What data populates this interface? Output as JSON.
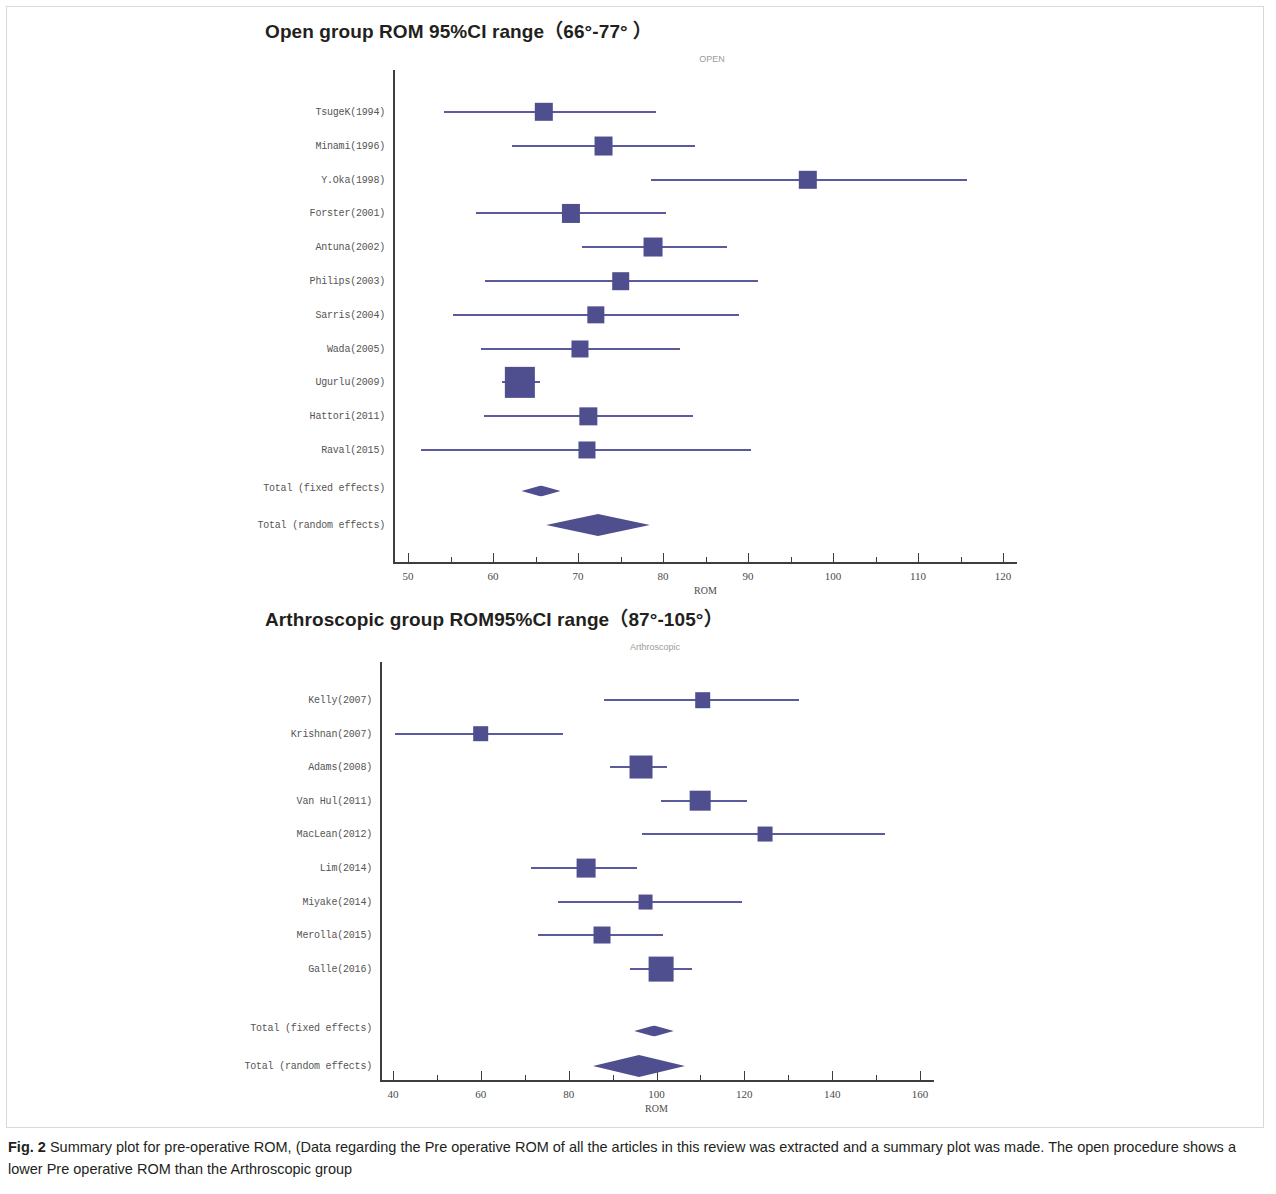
{
  "figure": {
    "caption_label": "Fig. 2",
    "caption_text": " Summary plot for pre-operative ROM, (Data regarding the Pre operative ROM of all the articles in this review was extracted and a summary plot was made. The open procedure shows a lower Pre operative ROM than the Arthroscopic group",
    "marker_color": "#4f4e8f",
    "line_color": "#5b5a9c",
    "axis_color": "#3d3d3d"
  },
  "panels": [
    {
      "heading": "Open group ROM 95%CI range（66°-77°  ）",
      "inner_title": "OPEN"
    },
    {
      "heading": "Arthroscopic group ROM95%CI range（87°-105°）",
      "inner_title": "Arthroscopic"
    }
  ],
  "chart_data": [
    {
      "type": "forest",
      "title": "OPEN",
      "panel_heading": "Open group ROM 95%CI range（66°-77°  ）",
      "xlabel": "ROM",
      "ylabel": "",
      "xlim": [
        48,
        122
      ],
      "xticks": [
        50,
        60,
        70,
        80,
        90,
        100,
        110,
        120
      ],
      "xtick_labels": [
        "50",
        "60",
        "70",
        "80",
        "90",
        "100",
        "110",
        "120"
      ],
      "minor_tick_step": 5,
      "grid": false,
      "legend": "none",
      "studies": [
        {
          "label": "TsugeK(1994)",
          "estimate": 66.0,
          "ci_low": 54.2,
          "ci_high": 79.2,
          "weight": 1.0
        },
        {
          "label": "Minami(1996)",
          "estimate": 73.0,
          "ci_low": 62.2,
          "ci_high": 83.8,
          "weight": 1.1
        },
        {
          "label": "Y.Oka(1998)",
          "estimate": 97.0,
          "ci_low": 78.6,
          "ci_high": 115.8,
          "weight": 1.0
        },
        {
          "label": "Forster(2001)",
          "estimate": 69.2,
          "ci_low": 58.0,
          "ci_high": 80.4,
          "weight": 0.95
        },
        {
          "label": "Antuna(2002)",
          "estimate": 78.8,
          "ci_low": 70.5,
          "ci_high": 87.5,
          "weight": 1.1
        },
        {
          "label": "Philips(2003)",
          "estimate": 75.0,
          "ci_low": 59.0,
          "ci_high": 91.2,
          "weight": 0.85
        },
        {
          "label": "Sarris(2004)",
          "estimate": 72.1,
          "ci_low": 55.3,
          "ci_high": 89.0,
          "weight": 0.8
        },
        {
          "label": "Wada(2005)",
          "estimate": 70.2,
          "ci_low": 58.6,
          "ci_high": 82.0,
          "weight": 0.75
        },
        {
          "label": "Ugurlu(2009)",
          "estimate": 63.2,
          "ci_low": 61.0,
          "ci_high": 65.5,
          "weight": 3.2
        },
        {
          "label": "Hattori(2011)",
          "estimate": 71.2,
          "ci_low": 58.9,
          "ci_high": 83.5,
          "weight": 0.8
        },
        {
          "label": "Raval(2015)",
          "estimate": 71.0,
          "ci_low": 51.5,
          "ci_high": 90.4,
          "weight": 0.75
        }
      ],
      "summaries": [
        {
          "label": "Total (fixed effects)",
          "estimate": 65.6,
          "ci_low": 63.3,
          "ci_high": 67.9
        },
        {
          "label": "Total (random effects)",
          "estimate": 72.4,
          "ci_low": 66.1,
          "ci_high": 78.3
        }
      ]
    },
    {
      "type": "forest",
      "title": "Arthroscopic",
      "panel_heading": "Arthroscopic group ROM95%CI range（87°-105°）",
      "xlabel": "ROM",
      "ylabel": "",
      "xlim": [
        37,
        163
      ],
      "xticks": [
        40,
        60,
        80,
        100,
        120,
        140,
        160
      ],
      "xtick_labels": [
        "40",
        "60",
        "80",
        "100",
        "120",
        "140",
        "160"
      ],
      "minor_tick_step": 10,
      "grid": false,
      "legend": "none",
      "studies": [
        {
          "label": "Kelly(2007)",
          "estimate": 110.5,
          "ci_low": 88.0,
          "ci_high": 132.5,
          "weight": 1.0
        },
        {
          "label": "Krishnan(2007)",
          "estimate": 60.0,
          "ci_low": 40.5,
          "ci_high": 78.6,
          "weight": 1.0
        },
        {
          "label": "Adams(2008)",
          "estimate": 96.5,
          "ci_low": 89.5,
          "ci_high": 102.5,
          "weight": 2.6
        },
        {
          "label": "Van Hul(2011)",
          "estimate": 110.0,
          "ci_low": 101.0,
          "ci_high": 120.5,
          "weight": 2.1
        },
        {
          "label": "MacLean(2012)",
          "estimate": 124.8,
          "ci_low": 96.6,
          "ci_high": 152.0,
          "weight": 0.85
        },
        {
          "label": "Lim(2014)",
          "estimate": 84.0,
          "ci_low": 71.5,
          "ci_high": 95.5,
          "weight": 1.7
        },
        {
          "label": "Miyake(2014)",
          "estimate": 97.5,
          "ci_low": 77.5,
          "ci_high": 119.5,
          "weight": 0.85
        },
        {
          "label": "Merolla(2015)",
          "estimate": 87.5,
          "ci_low": 73.0,
          "ci_high": 101.5,
          "weight": 1.3
        },
        {
          "label": "Galle(2016)",
          "estimate": 101.0,
          "ci_low": 94.0,
          "ci_high": 108.0,
          "weight": 3.0
        }
      ],
      "summaries": [
        {
          "label": "Total (fixed effects)",
          "estimate": 99.5,
          "ci_low": 95.0,
          "ci_high": 104.0
        },
        {
          "label": "Total (random effects)",
          "estimate": 96.0,
          "ci_low": 85.5,
          "ci_high": 106.5
        }
      ]
    }
  ]
}
